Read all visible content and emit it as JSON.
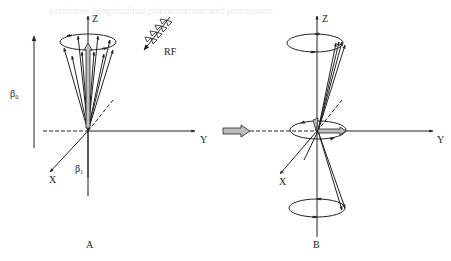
{
  "figure": {
    "background_bleed_text": "produces longitudinal  phenomenon  and  precession.",
    "panel_a": {
      "caption": "A",
      "axis_z": "Z",
      "axis_y": "Y",
      "axis_x": "X",
      "field_b0": "β₀",
      "field_b1": "β₁",
      "rf_label": "RF"
    },
    "panel_b": {
      "caption": "B",
      "axis_z": "Z",
      "axis_y": "Y",
      "axis_x": "X"
    },
    "colors": {
      "ink": "#222222",
      "arrow_fill": "#bdbdbd",
      "background": "#ffffff"
    }
  }
}
